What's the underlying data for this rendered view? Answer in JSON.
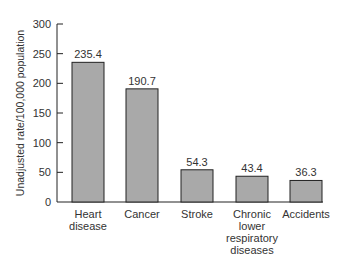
{
  "chart_data": {
    "type": "bar",
    "title": "",
    "xlabel": "",
    "ylabel": "Unadjusted rate/100,000 population",
    "categories": [
      "Heart disease",
      "Cancer",
      "Stroke",
      "Chronic lower respiratory diseases",
      "Accidents"
    ],
    "category_lines": [
      [
        "Heart",
        "disease"
      ],
      [
        "Cancer"
      ],
      [
        "Stroke"
      ],
      [
        "Chronic",
        "lower",
        "respiratory",
        "diseases"
      ],
      [
        "Accidents"
      ]
    ],
    "values": [
      235.4,
      190.7,
      54.3,
      43.4,
      36.3
    ],
    "value_labels": [
      "235.4",
      "190.7",
      "54.3",
      "43.4",
      "36.3"
    ],
    "ylim": [
      0,
      300
    ],
    "yticks": [
      0,
      50,
      100,
      150,
      200,
      250,
      300
    ],
    "grid": false,
    "legend": null,
    "bar_color": "#a9a9a9",
    "bar_edge_color": "#222222"
  }
}
